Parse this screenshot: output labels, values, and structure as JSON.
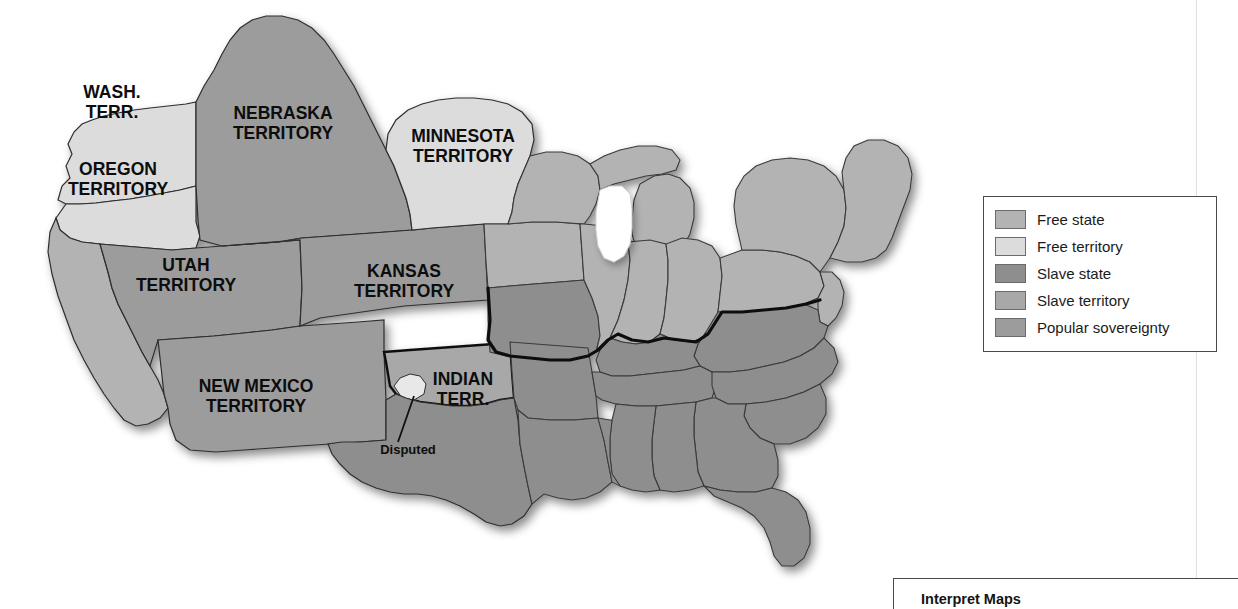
{
  "map": {
    "title": "United States 1854 slave and free states and territories",
    "labels": [
      {
        "id": "wash-terr",
        "lines": [
          "WASH.",
          "TERR."
        ],
        "x": 112,
        "y": 98,
        "size": "lg"
      },
      {
        "id": "oregon-terr",
        "lines": [
          "OREGON",
          "TERRITORY"
        ],
        "x": 118,
        "y": 175,
        "size": "lg"
      },
      {
        "id": "nebraska",
        "lines": [
          "NEBRASKA",
          "TERRITORY"
        ],
        "x": 283,
        "y": 119,
        "size": "lg"
      },
      {
        "id": "minnesota",
        "lines": [
          "MINNESOTA",
          "TERRITORY"
        ],
        "x": 463,
        "y": 142,
        "size": "lg"
      },
      {
        "id": "utah-terr",
        "lines": [
          "UTAH",
          "TERRITORY"
        ],
        "x": 186,
        "y": 271,
        "size": "lg"
      },
      {
        "id": "kansas-terr",
        "lines": [
          "KANSAS",
          "TERRITORY"
        ],
        "x": 404,
        "y": 277,
        "size": "lg"
      },
      {
        "id": "new-mexico",
        "lines": [
          "NEW MEXICO",
          "TERRITORY"
        ],
        "x": 256,
        "y": 392,
        "size": "lg"
      },
      {
        "id": "indian-terr",
        "lines": [
          "INDIAN",
          "TERR."
        ],
        "x": 463,
        "y": 385,
        "size": "lg"
      },
      {
        "id": "disputed",
        "lines": [
          "Disputed"
        ],
        "x": 408,
        "y": 454,
        "size": "sm"
      }
    ],
    "colors": {
      "free_state": "#b3b3b3",
      "free_territory": "#dcdcdc",
      "slave_state": "#8e8e8e",
      "slave_territory": "#a8a8a8",
      "popular_sovereignty": "#9c9c9c",
      "border": "#3a3a3a",
      "heavy_border": "#111111",
      "coast": "#ffffff",
      "background": "#ffffff"
    }
  },
  "legend": {
    "items": [
      {
        "label": "Free state",
        "color": "#b3b3b3"
      },
      {
        "label": "Free territory",
        "color": "#dcdcdc"
      },
      {
        "label": "Slave state",
        "color": "#8e8e8e"
      },
      {
        "label": "Slave territory",
        "color": "#a8a8a8"
      },
      {
        "label": "Popular sovereignty",
        "color": "#9c9c9c"
      }
    ]
  },
  "footer": {
    "title": "Interpret Maps"
  }
}
